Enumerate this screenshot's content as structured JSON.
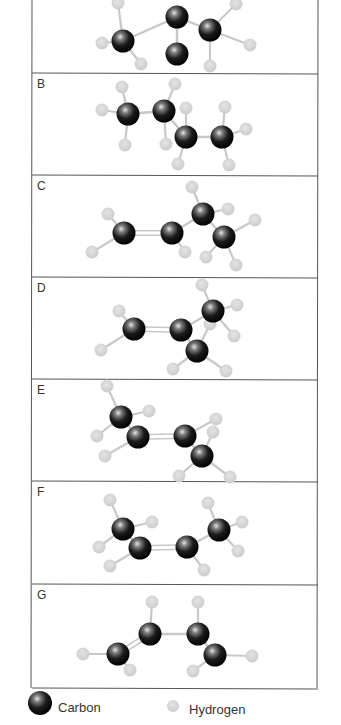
{
  "figure": {
    "type": "ball-and-stick molecular models",
    "border_color": "#555555",
    "bond_color": "#c8c8c8",
    "hydrogen_color": "#d2d2d2",
    "carbon_color": "#111111"
  },
  "panels": [
    {
      "label": "",
      "top": -30,
      "bottom": 73,
      "carbons": [
        [
          123,
          41
        ],
        [
          177,
          17
        ],
        [
          210,
          30
        ],
        [
          177,
          54
        ]
      ],
      "hydrogens": [
        [
          118,
          3
        ],
        [
          102,
          43
        ],
        [
          141,
          64
        ],
        [
          236,
          4
        ],
        [
          250,
          45
        ],
        [
          210,
          66
        ]
      ],
      "bonds": [
        [
          0,
          1
        ],
        [
          1,
          2
        ],
        [
          1,
          3
        ]
      ],
      "double_bonds": [],
      "h_bonds": [
        [
          0,
          0
        ],
        [
          0,
          1
        ],
        [
          0,
          2
        ],
        [
          2,
          3
        ],
        [
          2,
          4
        ],
        [
          2,
          5
        ]
      ]
    },
    {
      "label": "B",
      "top": 73,
      "bottom": 175,
      "carbons": [
        [
          128,
          114
        ],
        [
          164,
          111
        ],
        [
          186,
          137
        ],
        [
          222,
          137
        ]
      ],
      "hydrogens": [
        [
          122,
          87
        ],
        [
          102,
          110
        ],
        [
          125,
          145
        ],
        [
          175,
          84
        ],
        [
          186,
          108
        ],
        [
          166,
          144
        ],
        [
          178,
          164
        ],
        [
          225,
          107
        ],
        [
          246,
          129
        ],
        [
          229,
          165
        ]
      ],
      "bonds": [
        [
          0,
          1
        ],
        [
          1,
          2
        ],
        [
          2,
          3
        ]
      ],
      "double_bonds": [],
      "h_bonds": [
        [
          0,
          0
        ],
        [
          0,
          1
        ],
        [
          0,
          2
        ],
        [
          1,
          3
        ],
        [
          2,
          4
        ],
        [
          1,
          5
        ],
        [
          2,
          6
        ],
        [
          3,
          7
        ],
        [
          3,
          8
        ],
        [
          3,
          9
        ]
      ]
    },
    {
      "label": "C",
      "top": 175,
      "bottom": 277,
      "carbons": [
        [
          124,
          233
        ],
        [
          172,
          233
        ],
        [
          203,
          214
        ],
        [
          224,
          237
        ]
      ],
      "hydrogens": [
        [
          108,
          214
        ],
        [
          92,
          252
        ],
        [
          185,
          252
        ],
        [
          192,
          187
        ],
        [
          228,
          209
        ],
        [
          255,
          220
        ],
        [
          206,
          257
        ],
        [
          236,
          265
        ]
      ],
      "bonds": [
        [
          1,
          2
        ],
        [
          2,
          3
        ]
      ],
      "double_bonds": [
        [
          0,
          1
        ]
      ],
      "h_bonds": [
        [
          0,
          0
        ],
        [
          0,
          1
        ],
        [
          1,
          2
        ],
        [
          2,
          3
        ],
        [
          2,
          4
        ],
        [
          3,
          5
        ],
        [
          3,
          6
        ],
        [
          3,
          7
        ]
      ]
    },
    {
      "label": "D",
      "top": 277,
      "bottom": 379,
      "carbons": [
        [
          134,
          329
        ],
        [
          181,
          330
        ],
        [
          213,
          311
        ],
        [
          197,
          351
        ]
      ],
      "hydrogens": [
        [
          119,
          311
        ],
        [
          101,
          350
        ],
        [
          202,
          285
        ],
        [
          237,
          305
        ],
        [
          210,
          324
        ],
        [
          234,
          336
        ],
        [
          173,
          369
        ],
        [
          226,
          371
        ]
      ],
      "bonds": [
        [
          1,
          2
        ],
        [
          1,
          3
        ]
      ],
      "double_bonds": [
        [
          0,
          1
        ]
      ],
      "h_bonds": [
        [
          0,
          0
        ],
        [
          0,
          1
        ],
        [
          2,
          2
        ],
        [
          2,
          3
        ],
        [
          3,
          4
        ],
        [
          2,
          5
        ],
        [
          3,
          6
        ],
        [
          3,
          7
        ]
      ]
    },
    {
      "label": "E",
      "top": 379,
      "bottom": 481,
      "carbons": [
        [
          121,
          417
        ],
        [
          138,
          437
        ],
        [
          185,
          436
        ],
        [
          202,
          456
        ]
      ],
      "hydrogens": [
        [
          107,
          386
        ],
        [
          149,
          411
        ],
        [
          97,
          436
        ],
        [
          105,
          456
        ],
        [
          216,
          419
        ],
        [
          213,
          432
        ],
        [
          179,
          476
        ],
        [
          230,
          477
        ]
      ],
      "bonds": [
        [
          0,
          1
        ],
        [
          2,
          3
        ]
      ],
      "double_bonds": [
        [
          1,
          2
        ]
      ],
      "h_bonds": [
        [
          0,
          0
        ],
        [
          0,
          1
        ],
        [
          0,
          2
        ],
        [
          1,
          3
        ],
        [
          2,
          4
        ],
        [
          3,
          5
        ],
        [
          3,
          6
        ],
        [
          3,
          7
        ]
      ]
    },
    {
      "label": "F",
      "top": 481,
      "bottom": 584,
      "carbons": [
        [
          123,
          529
        ],
        [
          140,
          548
        ],
        [
          187,
          547
        ],
        [
          219,
          530
        ]
      ],
      "hydrogens": [
        [
          110,
          500
        ],
        [
          152,
          522
        ],
        [
          99,
          547
        ],
        [
          110,
          566
        ],
        [
          208,
          503
        ],
        [
          242,
          522
        ],
        [
          204,
          570
        ],
        [
          238,
          551
        ]
      ],
      "bonds": [
        [
          0,
          1
        ],
        [
          2,
          3
        ]
      ],
      "double_bonds": [
        [
          1,
          2
        ]
      ],
      "h_bonds": [
        [
          0,
          0
        ],
        [
          0,
          1
        ],
        [
          0,
          2
        ],
        [
          1,
          3
        ],
        [
          3,
          4
        ],
        [
          3,
          5
        ],
        [
          2,
          6
        ],
        [
          3,
          7
        ]
      ]
    },
    {
      "label": "G",
      "top": 584,
      "bottom": 688,
      "carbons": [
        [
          118,
          654
        ],
        [
          150,
          634
        ],
        [
          198,
          634
        ],
        [
          215,
          655
        ]
      ],
      "hydrogens": [
        [
          83,
          654
        ],
        [
          130,
          670
        ],
        [
          152,
          602
        ],
        [
          198,
          602
        ],
        [
          252,
          656
        ],
        [
          193,
          671
        ]
      ],
      "bonds": [
        [
          1,
          2
        ],
        [
          2,
          3
        ]
      ],
      "double_bonds": [
        [
          0,
          1
        ]
      ],
      "h_bonds": [
        [
          0,
          0
        ],
        [
          0,
          1
        ],
        [
          1,
          2
        ],
        [
          2,
          3
        ],
        [
          3,
          4
        ],
        [
          3,
          5
        ]
      ]
    }
  ],
  "legend": {
    "carbon_label": "Carbon",
    "hydrogen_label": "Hydrogen"
  }
}
